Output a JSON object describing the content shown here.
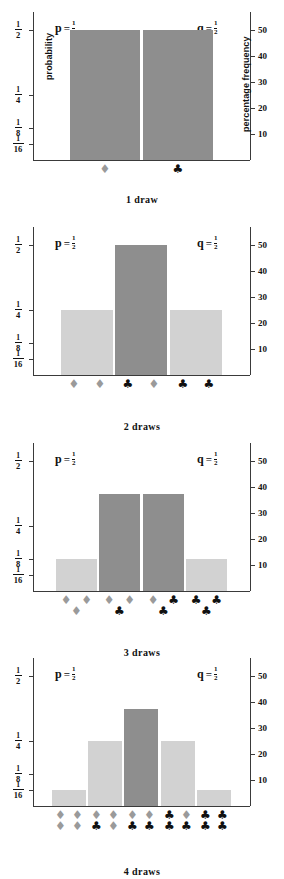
{
  "figure": {
    "left_axis_title": "probability",
    "right_axis_title": "percentage frequency",
    "left_ticks": [
      {
        "num": "1",
        "den": "2",
        "value": 0.5
      },
      {
        "num": "1",
        "den": "4",
        "value": 0.25
      },
      {
        "num": "1",
        "den": "8",
        "value": 0.125
      },
      {
        "num": "1",
        "den": "16",
        "value": 0.0625
      }
    ],
    "right_ticks": [
      "50",
      "40",
      "30",
      "20",
      "10"
    ],
    "p_symbol": "p",
    "q_symbol": "q",
    "equals": "=",
    "p_num": "1",
    "p_den": "2",
    "q_num": "1",
    "q_den": "2",
    "diamond_glyph": "♦",
    "club_glyph": "♣",
    "diamond_color": "#9a9a9a",
    "club_color": "#111111",
    "bar_color_light": "#d2d2d2",
    "bar_color_dark": "#8e8e8e",
    "axis_color": "#3a3a3a"
  },
  "chart_data": [
    {
      "type": "bar",
      "title": "1 draw",
      "categories": [
        "♦",
        "♣"
      ],
      "values": [
        50,
        50
      ],
      "probabilities": [
        "1/2",
        "1/2"
      ],
      "shades": [
        "dark",
        "dark"
      ],
      "suit_groups": [
        [
          "d"
        ],
        [
          "c"
        ]
      ],
      "xlabel": "",
      "ylabel": "probability",
      "ylabel_right": "percentage frequency",
      "ylim": [
        0,
        57
      ],
      "grid": false
    },
    {
      "type": "bar",
      "title": "2 draws",
      "categories": [
        "♦♦",
        "♣♦",
        "♣♣"
      ],
      "values": [
        25,
        50,
        25
      ],
      "probabilities": [
        "1/4",
        "1/2",
        "1/4"
      ],
      "shades": [
        "light",
        "dark",
        "light"
      ],
      "suit_groups": [
        [
          "d",
          "d"
        ],
        [
          "c",
          "d"
        ],
        [
          "c",
          "c"
        ]
      ],
      "xlabel": "",
      "ylabel": "probability",
      "ylabel_right": "percentage frequency",
      "ylim": [
        0,
        57
      ],
      "grid": false
    },
    {
      "type": "bar",
      "title": "3 draws",
      "categories": [
        "♦♦♦",
        "♦♦♣",
        "♦♣♣",
        "♣♣♣"
      ],
      "values": [
        12.5,
        37.5,
        37.5,
        12.5
      ],
      "probabilities": [
        "1/8",
        "3/8",
        "3/8",
        "1/8"
      ],
      "shades": [
        "light",
        "dark",
        "dark",
        "light"
      ],
      "suit_groups": [
        [
          "d",
          "d",
          "d"
        ],
        [
          "d",
          "d",
          "c"
        ],
        [
          "d",
          "c",
          "c"
        ],
        [
          "c",
          "c",
          "c"
        ]
      ],
      "xlabel": "",
      "ylabel": "probability",
      "ylabel_right": "percentage frequency",
      "ylim": [
        0,
        57
      ],
      "grid": false
    },
    {
      "type": "bar",
      "title": "4 draws",
      "categories": [
        "♦♦♦♦",
        "♦♦♣♦",
        "♦♦♣♣",
        "♣♦♣♣",
        "♣♣♣♣"
      ],
      "values": [
        6.25,
        25,
        37.5,
        25,
        6.25
      ],
      "probabilities": [
        "1/16",
        "1/4",
        "3/8",
        "1/4",
        "1/16"
      ],
      "shades": [
        "light",
        "light",
        "dark",
        "light",
        "light"
      ],
      "suit_groups": [
        [
          "d",
          "d",
          "d",
          "d"
        ],
        [
          "d",
          "d",
          "c",
          "d"
        ],
        [
          "d",
          "d",
          "c",
          "c"
        ],
        [
          "c",
          "d",
          "c",
          "c"
        ],
        [
          "c",
          "c",
          "c",
          "c"
        ]
      ],
      "xlabel": "",
      "ylabel": "probability",
      "ylabel_right": "percentage frequency",
      "ylim": [
        0,
        57
      ],
      "grid": false
    }
  ]
}
